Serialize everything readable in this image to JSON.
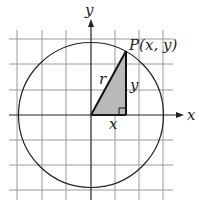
{
  "diagram": {
    "type": "unit-circle-trig-definition",
    "colors": {
      "grid": "#9a9a9a",
      "axis": "#222222",
      "circle": "#222222",
      "triangle_fill": "#b9b9b9",
      "triangle_stroke": "#111111"
    },
    "labels": {
      "y_axis": "y",
      "x_axis": "x",
      "point": "P(x, y)",
      "radius": "r",
      "leg_vertical": "y",
      "leg_horizontal": "x"
    },
    "geometry": {
      "origin": [
        91,
        115
      ],
      "grid_spacing": 24.5,
      "circle_radius": 72.5,
      "point_P": [
        126,
        51
      ]
    }
  }
}
